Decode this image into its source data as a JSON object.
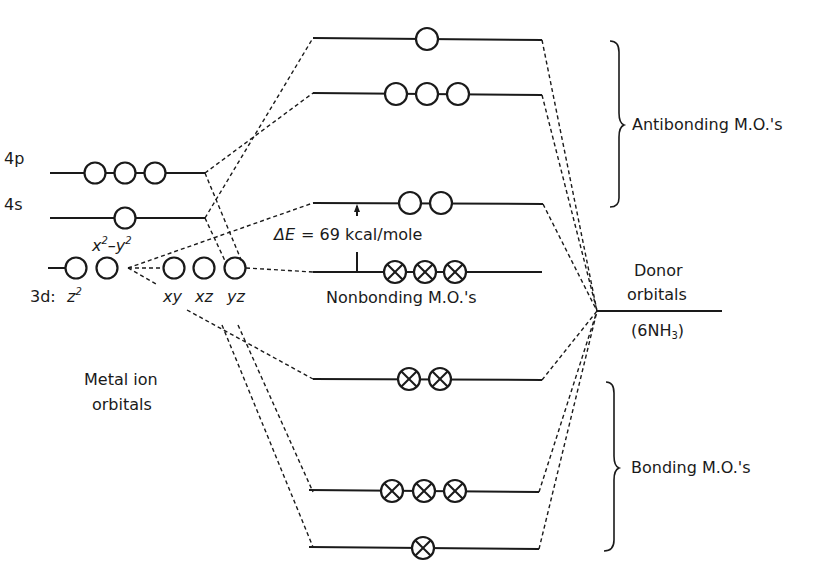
{
  "colors": {
    "ink": "#1a1a1a",
    "background": "#ffffff"
  },
  "labels": {
    "metal_4p": "4p",
    "metal_4s": "4s",
    "metal_3d_prefix": "3d:",
    "z2": "z",
    "z2_sup": "2",
    "x2y2_x": "x",
    "x2y2_sup1": "2",
    "x2y2_minus": "–",
    "x2y2_y": "y",
    "x2y2_sup2": "2",
    "xy": "xy",
    "xz": "xz",
    "yz": "yz",
    "delta_e_symbol": "ΔE",
    "delta_e_value": "= 69 kcal/mole",
    "nonbonding": "Nonbonding M.O.'s",
    "metal_ion_line1": "Metal ion",
    "metal_ion_line2": "orbitals",
    "donor_line1": "Donor",
    "donor_line2": "orbitals",
    "ligand_prefix": "(6NH",
    "ligand_sub": "3",
    "ligand_suffix": ")",
    "antibonding": "Antibonding M.O.'s",
    "bonding": "Bonding M.O.'s"
  },
  "diagram": {
    "metal_levels": [
      {
        "name": "4p",
        "y": 173,
        "orbitals": 3,
        "filled": false
      },
      {
        "name": "4s",
        "y": 218,
        "orbitals": 1,
        "filled": false
      },
      {
        "name": "3d eg (z2, x2-y2)",
        "y": 268,
        "orbitals": 2,
        "filled": false
      },
      {
        "name": "3d t2g (xy, xz, yz)",
        "y": 268,
        "orbitals": 3,
        "filled": false
      }
    ],
    "mo_levels": [
      {
        "name": "antibonding a1g*",
        "y": 38,
        "orbitals": 1,
        "filled": false
      },
      {
        "name": "antibonding t1u*",
        "y": 93,
        "orbitals": 3,
        "filled": false
      },
      {
        "name": "antibonding eg*",
        "y": 203,
        "orbitals": 2,
        "filled": false
      },
      {
        "name": "nonbonding t2g",
        "y": 272,
        "orbitals": 3,
        "filled": true
      },
      {
        "name": "bonding eg",
        "y": 379,
        "orbitals": 2,
        "filled": true
      },
      {
        "name": "bonding t1u",
        "y": 492,
        "orbitals": 3,
        "filled": true
      },
      {
        "name": "bonding a1g",
        "y": 547,
        "orbitals": 1,
        "filled": true
      }
    ],
    "donor_level": {
      "name": "Donor orbitals (6NH3)",
      "y": 311
    },
    "delta_e_kcal_per_mole": 69
  }
}
